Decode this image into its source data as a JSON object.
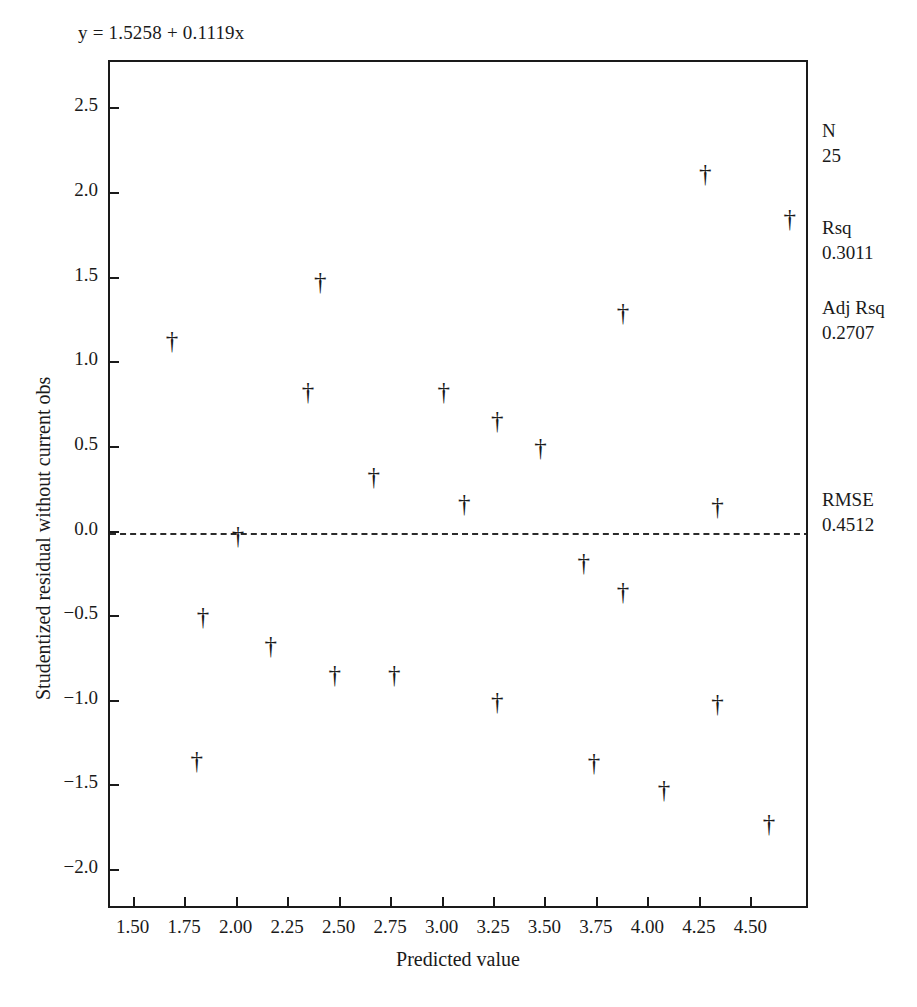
{
  "equation": "y = 1.5258 + 0.1119x",
  "axes": {
    "xlabel": "Predicted value",
    "ylabel": "Studentized residual without current obs",
    "xticks": [
      "1.50",
      "1.75",
      "2.00",
      "2.25",
      "2.50",
      "2.75",
      "3.00",
      "3.25",
      "3.50",
      "3.75",
      "4.00",
      "4.25",
      "4.50"
    ],
    "xtick_values": [
      1.5,
      1.75,
      2.0,
      2.25,
      2.5,
      2.75,
      3.0,
      3.25,
      3.5,
      3.75,
      4.0,
      4.25,
      4.5
    ],
    "yticks": [
      "2.5",
      "2.0",
      "1.5",
      "1.0",
      "0.5",
      "0.0",
      "−0.5",
      "−1.0",
      "−1.5",
      "−2.0"
    ],
    "ytick_values": [
      2.5,
      2.0,
      1.5,
      1.0,
      0.5,
      0.0,
      -0.5,
      -1.0,
      -1.5,
      -2.0
    ]
  },
  "stats": [
    {
      "name": "N",
      "value": "25"
    },
    {
      "name": "Rsq",
      "value": "0.3011"
    },
    {
      "name": "Adj Rsq",
      "value": "0.2707"
    },
    {
      "name": "RMSE",
      "value": "0.4512"
    }
  ],
  "marker": {
    "glyph": "†",
    "name": "dagger"
  },
  "chart_data": {
    "type": "scatter",
    "title": "",
    "annotation": "y = 1.5258 + 0.1119x",
    "xlabel": "Predicted value",
    "ylabel": "Studentized residual without current obs",
    "xlim": [
      1.38,
      4.78
    ],
    "ylim": [
      -2.23,
      2.78
    ],
    "grid": false,
    "legend": "none",
    "reference_line": {
      "y": 0.0,
      "style": "dashed"
    },
    "marker_symbol": "dagger",
    "n": 25,
    "rsq": 0.3011,
    "adj_rsq": 0.2707,
    "rmse": 0.4512,
    "points": [
      {
        "x": 1.68,
        "y": 1.13
      },
      {
        "x": 1.8,
        "y": -1.35
      },
      {
        "x": 1.83,
        "y": -0.5
      },
      {
        "x": 2.0,
        "y": -0.02
      },
      {
        "x": 2.16,
        "y": -0.67
      },
      {
        "x": 2.34,
        "y": 0.83
      },
      {
        "x": 2.4,
        "y": 1.48
      },
      {
        "x": 2.47,
        "y": -0.84
      },
      {
        "x": 2.66,
        "y": 0.33
      },
      {
        "x": 2.76,
        "y": -0.84
      },
      {
        "x": 3.0,
        "y": 0.83
      },
      {
        "x": 3.1,
        "y": 0.17
      },
      {
        "x": 3.26,
        "y": 0.66
      },
      {
        "x": 3.26,
        "y": -1.0
      },
      {
        "x": 3.47,
        "y": 0.5
      },
      {
        "x": 3.68,
        "y": -0.18
      },
      {
        "x": 3.73,
        "y": -1.36
      },
      {
        "x": 3.87,
        "y": 1.3
      },
      {
        "x": 3.87,
        "y": -0.35
      },
      {
        "x": 4.07,
        "y": -1.52
      },
      {
        "x": 4.27,
        "y": 2.12
      },
      {
        "x": 4.33,
        "y": 0.15
      },
      {
        "x": 4.33,
        "y": -1.01
      },
      {
        "x": 4.58,
        "y": -1.72
      },
      {
        "x": 4.68,
        "y": 1.85
      }
    ]
  }
}
